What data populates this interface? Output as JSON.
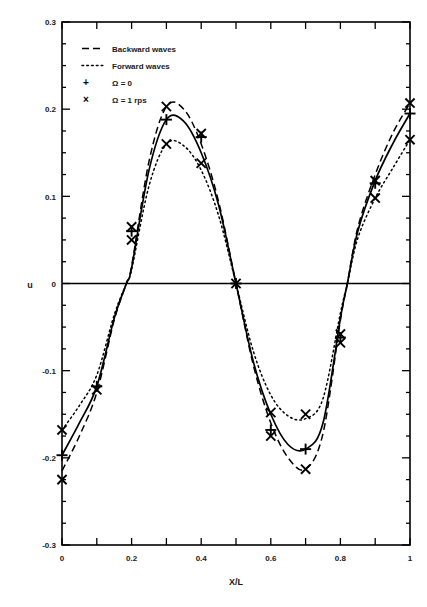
{
  "figure": {
    "background_color": "#ffffff",
    "ink_color": "#000000"
  },
  "axes": {
    "xlabel": "X/L",
    "ylabel": "u",
    "x_tick_labels": [
      "0",
      "0.2",
      "0.4",
      "0.6",
      "0.8",
      "1"
    ],
    "y_tick_labels": [
      "0.3",
      "0.2",
      "0.1",
      "0",
      "-0.1",
      "-0.2",
      "-0.3"
    ]
  },
  "legend": {
    "entries": [
      {
        "label": "Backward waves",
        "style": "dashed",
        "symbol": ""
      },
      {
        "label": "Forward waves",
        "style": "dotted",
        "symbol": ""
      },
      {
        "label": "Ω = 0",
        "style": "marker",
        "symbol": "+"
      },
      {
        "label": "Ω = 1 rps",
        "style": "marker",
        "symbol": "×"
      }
    ]
  },
  "caption": {
    "text": ""
  },
  "chart_data": {
    "type": "line",
    "title": "",
    "xlabel": "X/L",
    "ylabel": "u",
    "xlim": [
      0,
      1
    ],
    "ylim": [
      -0.3,
      0.3
    ],
    "grid": false,
    "legend_position": "top-left inside",
    "x_ticks_major": [
      0,
      0.2,
      0.4,
      0.6,
      0.8,
      1
    ],
    "x_ticks_minor": [
      0.1,
      0.3,
      0.5,
      0.7,
      0.9
    ],
    "y_ticks_major": [
      -0.3,
      -0.2,
      -0.1,
      0,
      0.1,
      0.2,
      0.3
    ],
    "y_minor_step": 0.025,
    "zero_crossings": [
      0.185,
      0.5,
      0.82
    ],
    "series": [
      {
        "name": "Standing wave (solid)",
        "style": "solid",
        "x": [
          0.0,
          0.05,
          0.1,
          0.15,
          0.185,
          0.2,
          0.25,
          0.3,
          0.35,
          0.4,
          0.45,
          0.5,
          0.55,
          0.6,
          0.65,
          0.7,
          0.75,
          0.8,
          0.82,
          0.85,
          0.9,
          0.95,
          1.0
        ],
        "values": [
          -0.197,
          -0.16,
          -0.118,
          -0.04,
          0.0,
          0.018,
          0.13,
          0.188,
          0.186,
          0.15,
          0.09,
          0.0,
          -0.09,
          -0.15,
          -0.185,
          -0.19,
          -0.16,
          -0.04,
          0.0,
          0.06,
          0.118,
          0.16,
          0.195
        ]
      },
      {
        "name": "Backward waves",
        "style": "dashed",
        "x": [
          0.0,
          0.05,
          0.1,
          0.15,
          0.185,
          0.2,
          0.25,
          0.3,
          0.35,
          0.4,
          0.45,
          0.5,
          0.55,
          0.6,
          0.65,
          0.7,
          0.75,
          0.8,
          0.82,
          0.85,
          0.9,
          0.95,
          1.0
        ],
        "values": [
          -0.215,
          -0.175,
          -0.125,
          -0.042,
          0.0,
          0.02,
          0.14,
          0.203,
          0.2,
          0.16,
          0.094,
          0.0,
          -0.094,
          -0.16,
          -0.2,
          -0.213,
          -0.172,
          -0.042,
          0.0,
          0.064,
          0.125,
          0.172,
          0.207
        ]
      },
      {
        "name": "Forward waves",
        "style": "dotted",
        "x": [
          0.0,
          0.05,
          0.1,
          0.15,
          0.185,
          0.2,
          0.25,
          0.3,
          0.35,
          0.4,
          0.45,
          0.5,
          0.55,
          0.6,
          0.65,
          0.7,
          0.75,
          0.8,
          0.82,
          0.85,
          0.9,
          0.95,
          1.0
        ],
        "values": [
          -0.168,
          -0.14,
          -0.105,
          -0.036,
          0.0,
          0.016,
          0.112,
          0.16,
          0.158,
          0.13,
          0.078,
          0.0,
          -0.078,
          -0.128,
          -0.152,
          -0.155,
          -0.132,
          -0.034,
          0.0,
          0.052,
          0.098,
          0.132,
          0.165
        ]
      }
    ],
    "markers": [
      {
        "name": "Ω = 0",
        "symbol": "+",
        "x": [
          0.0,
          0.1,
          0.2,
          0.3,
          0.4,
          0.5,
          0.6,
          0.7,
          0.8,
          0.9,
          1.0
        ],
        "values": [
          -0.197,
          -0.118,
          0.06,
          0.188,
          0.168,
          0.0,
          -0.168,
          -0.19,
          -0.062,
          0.115,
          0.195
        ]
      },
      {
        "name": "Ω = 1 rps",
        "symbol": "×",
        "x": [
          0.0,
          0.0,
          0.1,
          0.2,
          0.2,
          0.3,
          0.3,
          0.4,
          0.4,
          0.5,
          0.6,
          0.6,
          0.7,
          0.7,
          0.8,
          0.8,
          0.9,
          0.9,
          1.0,
          1.0
        ],
        "values": [
          -0.225,
          -0.168,
          -0.122,
          0.065,
          0.05,
          0.203,
          0.16,
          0.172,
          0.138,
          0.0,
          -0.148,
          -0.175,
          -0.213,
          -0.15,
          -0.068,
          -0.058,
          0.118,
          0.098,
          0.207,
          0.165
        ]
      }
    ]
  }
}
